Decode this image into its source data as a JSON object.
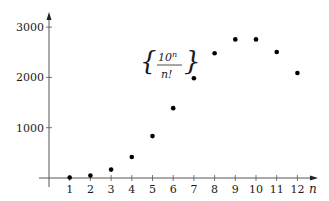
{
  "chart_data": {
    "type": "scatter",
    "title": "",
    "annotation": {
      "numerator_base": "10",
      "numerator_exp": "n",
      "denominator": "n!"
    },
    "xlabel": "n",
    "ylabel": "",
    "x": [
      1,
      2,
      3,
      4,
      5,
      6,
      7,
      8,
      9,
      10,
      11,
      12
    ],
    "series": [
      {
        "name": "10^n / n!",
        "values": [
          10,
          50,
          166.7,
          416.7,
          833.3,
          1388.9,
          1984.1,
          2480.2,
          2755.7,
          2755.7,
          2505.2,
          2087.7
        ]
      }
    ],
    "xticks": [
      "1",
      "2",
      "3",
      "4",
      "5",
      "6",
      "7",
      "8",
      "9",
      "10",
      "11",
      "12"
    ],
    "yticks": [
      "1000",
      "2000",
      "3000"
    ],
    "ytick_values": [
      1000,
      2000,
      3000
    ],
    "xlim": [
      0,
      12.8
    ],
    "ylim": [
      0,
      3300
    ],
    "grid": false,
    "legend": null,
    "colors": {
      "axis": "#555555",
      "point": "#000000",
      "text": "#1a1a1a"
    }
  }
}
